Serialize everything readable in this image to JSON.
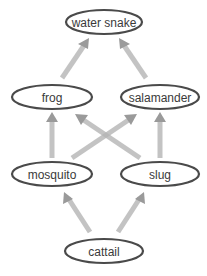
{
  "diagram": {
    "type": "food-web",
    "colors": {
      "node_stroke": "#4a4a4a",
      "node_fill": "#ffffff",
      "label": "#3a3a3a",
      "arrow": "#9a9a9a"
    },
    "nodes": [
      {
        "id": "water_snake",
        "label": "water snake",
        "cx": 104,
        "cy": 22,
        "rx": 38,
        "ry": 12
      },
      {
        "id": "frog",
        "label": "frog",
        "cx": 52,
        "cy": 97,
        "rx": 40,
        "ry": 12
      },
      {
        "id": "salamander",
        "label": "salamander",
        "cx": 160,
        "cy": 97,
        "rx": 39,
        "ry": 12
      },
      {
        "id": "mosquito",
        "label": "mosquito",
        "cx": 52,
        "cy": 174,
        "rx": 40,
        "ry": 12
      },
      {
        "id": "slug",
        "label": "slug",
        "cx": 160,
        "cy": 174,
        "rx": 39,
        "ry": 12
      },
      {
        "id": "cattail",
        "label": "cattail",
        "cx": 104,
        "cy": 251,
        "rx": 39,
        "ry": 12
      }
    ],
    "edges": [
      {
        "from": "frog",
        "to": "water_snake"
      },
      {
        "from": "salamander",
        "to": "water_snake"
      },
      {
        "from": "mosquito",
        "to": "frog"
      },
      {
        "from": "slug",
        "to": "frog"
      },
      {
        "from": "mosquito",
        "to": "salamander"
      },
      {
        "from": "slug",
        "to": "salamander"
      },
      {
        "from": "cattail",
        "to": "mosquito"
      },
      {
        "from": "cattail",
        "to": "slug"
      }
    ]
  }
}
